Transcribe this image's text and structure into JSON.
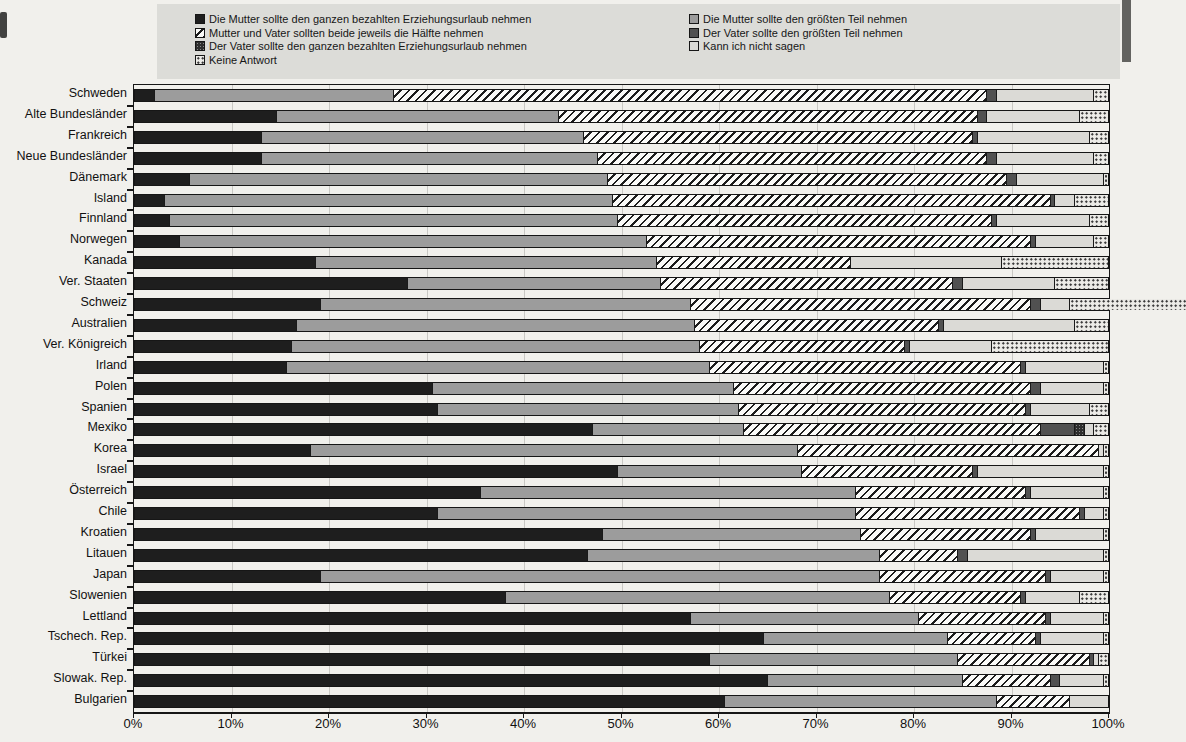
{
  "legend": {
    "columns": [
      {
        "items": [
          {
            "key": "mutter_ganz",
            "label": "Die Mutter sollte den ganzen bezahlten Erziehungsurlaub nehmen"
          },
          {
            "key": "haelfte",
            "label": "Mutter und Vater sollten beide jeweils die Hälfte nehmen"
          },
          {
            "key": "vater_ganz",
            "label": "Der Vater sollte den ganzen bezahlten Erziehungsurlaub nehmen"
          },
          {
            "key": "keine",
            "label": "Keine Antwort"
          }
        ]
      },
      {
        "items": [
          {
            "key": "mutter_groesste",
            "label": "Die Mutter sollte den größten Teil nehmen"
          },
          {
            "key": "vater_groesste",
            "label": "Der Vater sollte den größten Teil nehmen"
          },
          {
            "key": "kann",
            "label": "Kann ich nicht sagen"
          }
        ]
      }
    ]
  },
  "chart_data": {
    "type": "bar",
    "stacked": true,
    "orientation": "horizontal",
    "unit": "percent",
    "xlim": [
      0,
      100
    ],
    "grid": true,
    "x_tick_labels": [
      "0%",
      "10%",
      "20%",
      "30%",
      "40%",
      "50%",
      "60%",
      "70%",
      "80%",
      "90%",
      "100%"
    ],
    "categories": [
      "Schweden",
      "Alte Bundesländer",
      "Frankreich",
      "Neue Bundesländer",
      "Dänemark",
      "Island",
      "Finnland",
      "Norwegen",
      "Kanada",
      "Ver. Staaten",
      "Schweiz",
      "Australien",
      "Ver. Königreich",
      "Irland",
      "Polen",
      "Spanien",
      "Mexiko",
      "Korea",
      "Israel",
      "Österreich",
      "Chile",
      "Kroatien",
      "Litauen",
      "Japan",
      "Slowenien",
      "Lettland",
      "Tschech. Rep.",
      "Türkei",
      "Slowak. Rep.",
      "Bulgarien"
    ],
    "series": [
      {
        "key": "mutter_ganz",
        "name": "Die Mutter sollte den ganzen bezahlten Erziehungsurlaub nehmen",
        "values": [
          2,
          14.5,
          13,
          13,
          5.5,
          3,
          3.5,
          4.5,
          18.5,
          28,
          19,
          16.5,
          16,
          15.5,
          30.5,
          31,
          47,
          18,
          49.5,
          35.5,
          31,
          48,
          46.5,
          19,
          38,
          57,
          64.5,
          59,
          65,
          60.5
        ]
      },
      {
        "key": "mutter_groesste",
        "name": "Die Mutter sollte den größten Teil nehmen",
        "values": [
          24.5,
          29,
          33,
          34.5,
          43,
          46,
          46,
          48,
          35,
          26,
          38,
          41,
          42,
          43.5,
          31,
          31,
          15.5,
          50,
          19,
          38.5,
          43,
          26.5,
          30,
          57.5,
          39.5,
          23.5,
          19,
          25.5,
          20,
          28
        ]
      },
      {
        "key": "haelfte",
        "name": "Mutter und Vater sollten beide jeweils die Hälfte nehmen",
        "values": [
          61,
          43,
          40,
          40,
          41,
          45,
          38.5,
          39.5,
          20,
          30,
          35,
          25,
          21,
          32,
          30.5,
          29.5,
          30.5,
          31,
          17.5,
          17.5,
          23,
          17.5,
          8,
          17,
          13.5,
          13,
          9,
          13.5,
          9,
          7.5
        ]
      },
      {
        "key": "vater_groesste",
        "name": "Der Vater sollte den größten Teil nehmen",
        "values": [
          1,
          1,
          0.5,
          1,
          1,
          0.5,
          0.5,
          0.5,
          0,
          1,
          1,
          0.5,
          0.5,
          0.5,
          1,
          0.5,
          3.5,
          0,
          0.5,
          0.5,
          0.5,
          0.5,
          1,
          0.5,
          0.5,
          0.5,
          0.5,
          0.5,
          1,
          0
        ]
      },
      {
        "key": "vater_ganz",
        "name": "Der Vater sollte den ganzen bezahlten Erziehungsurlaub nehmen",
        "values": [
          0,
          0,
          0,
          0,
          0,
          0,
          0,
          0,
          0,
          0,
          0,
          0,
          0,
          0,
          0,
          0,
          1,
          0,
          0,
          0,
          0,
          0,
          0,
          0,
          0,
          0,
          0,
          0,
          0,
          0
        ]
      },
      {
        "key": "kann",
        "name": "Kann ich nicht sagen",
        "values": [
          10,
          9.5,
          11.5,
          10,
          9,
          2,
          9.5,
          6,
          15.5,
          9.5,
          3,
          13.5,
          8.5,
          8,
          6.5,
          6,
          1,
          0.5,
          13,
          7.5,
          2,
          7,
          14,
          5.5,
          5.5,
          5.5,
          6.5,
          0.5,
          4.5,
          4
        ]
      },
      {
        "key": "keine",
        "name": "Keine Antwort",
        "values": [
          1.5,
          3,
          2,
          1.5,
          0.5,
          3.5,
          2,
          1.5,
          11,
          5.5,
          12,
          3.5,
          12,
          0.5,
          0.5,
          2,
          1.5,
          0.5,
          0.5,
          0.5,
          0.5,
          0.5,
          0.5,
          0.5,
          3,
          0.5,
          0.5,
          1,
          0.5,
          0
        ]
      }
    ]
  }
}
